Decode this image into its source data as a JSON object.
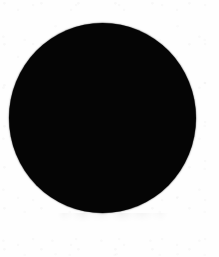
{
  "canvas": {
    "width": 219,
    "height": 257,
    "background_color": "#fefefe"
  },
  "figure": {
    "description": "Solid black filled circle on a plain white scanned page",
    "shapes": [
      {
        "name": "black-disc",
        "kind": "circle",
        "fill_color": "#050505",
        "center_x": 102,
        "center_y": 118,
        "radius_x": 93,
        "radius_y": 95,
        "left": 9,
        "top": 23,
        "width": 187,
        "height": 190,
        "stroke": "none",
        "edge": "soft-antialiased"
      }
    ],
    "artifacts": [
      {
        "name": "scan-smudge",
        "kind": "faint-grey-residue",
        "left": 57,
        "top": 213,
        "width": 112,
        "height": 10,
        "opacity": 0.3,
        "legible_text": ""
      }
    ],
    "text_content": [],
    "caption": ""
  }
}
